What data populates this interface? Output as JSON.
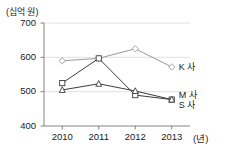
{
  "chart_data": {
    "type": "line",
    "title": "",
    "subtitle": "",
    "unit_label": "(십억 원)",
    "xlabel": "(년)",
    "ylabel": "",
    "categories": [
      "2010",
      "2011",
      "2012",
      "2013"
    ],
    "x_tick_labels": [
      "2010",
      "2011",
      "2012",
      "2013"
    ],
    "y_tick_labels": [
      "400",
      "500",
      "600",
      "700"
    ],
    "y_ticks": [
      400,
      500,
      600,
      700
    ],
    "ylim": [
      400,
      700
    ],
    "grid": true,
    "grid_axis": "y",
    "legend_position": "right-inline",
    "series": [
      {
        "name": "K 사",
        "label": "K 사",
        "marker": "diamond",
        "color": "#9a9a9a",
        "values": [
          590,
          597,
          625,
          572
        ]
      },
      {
        "name": "M 사",
        "label": "M 사",
        "marker": "square",
        "color": "#3c3c3c",
        "values": [
          525,
          597,
          490,
          477
        ]
      },
      {
        "name": "S 사",
        "label": "S 사",
        "marker": "triangle",
        "color": "#3c3c3c",
        "values": [
          505,
          523,
          502,
          477
        ]
      }
    ]
  }
}
